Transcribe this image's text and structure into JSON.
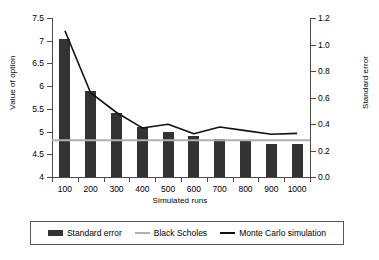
{
  "chart_data": {
    "type": "bar",
    "title": "",
    "subtitle": "",
    "xlabel": "Simulated runs",
    "ylabel": "Value of option",
    "y2label": "Standard error",
    "categories": [
      "100",
      "200",
      "300",
      "400",
      "500",
      "600",
      "700",
      "800",
      "900",
      "1000"
    ],
    "x": [
      100,
      200,
      300,
      400,
      500,
      600,
      700,
      800,
      900,
      1000
    ],
    "ylim": [
      4,
      7.5
    ],
    "y2lim": [
      0.0,
      1.2
    ],
    "yticks": [
      "4",
      "4.5",
      "5",
      "5.5",
      "6",
      "6.5",
      "7",
      "7.5"
    ],
    "ytick_values": [
      4,
      4.5,
      5,
      5.5,
      6,
      6.5,
      7,
      7.5
    ],
    "y2ticks": [
      "0.0",
      "0.2",
      "0.4",
      "0.6",
      "0.8",
      "1.0",
      "1.2"
    ],
    "y2tick_values": [
      0.0,
      0.2,
      0.4,
      0.6,
      0.8,
      1.0,
      1.2
    ],
    "grid": false,
    "legend_position": "bottom",
    "series": [
      {
        "name": "Standard error",
        "type": "bar",
        "axis": "right",
        "color": "#333333",
        "values": [
          1.04,
          0.65,
          0.48,
          0.38,
          0.34,
          0.31,
          0.29,
          0.27,
          0.25,
          0.25
        ]
      },
      {
        "name": "Black Scholes",
        "type": "line",
        "axis": "left",
        "color": "#b0b0b0",
        "values": [
          4.81,
          4.81,
          4.81,
          4.81,
          4.81,
          4.81,
          4.81,
          4.81,
          4.81,
          4.81
        ]
      },
      {
        "name": "Monte Carlo simulation",
        "type": "line",
        "axis": "left",
        "color": "#111111",
        "values": [
          7.22,
          5.85,
          5.42,
          5.08,
          5.16,
          4.95,
          5.1,
          5.02,
          4.94,
          4.96
        ]
      }
    ]
  },
  "legend": {
    "entries": [
      {
        "label": "Standard error",
        "swatch": "bar-swatch",
        "color": "#333333"
      },
      {
        "label": "Black Scholes",
        "swatch": "line-swatch-gray",
        "color": "#b0b0b0"
      },
      {
        "label": "Monte Carlo simulation",
        "swatch": "line-swatch-black",
        "color": "#111111"
      }
    ]
  }
}
